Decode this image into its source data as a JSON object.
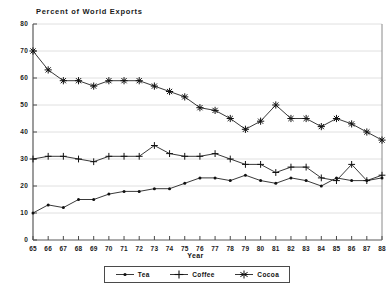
{
  "chart_data": {
    "type": "line",
    "title": "Percent of World Exports",
    "xlabel": "Year",
    "ylabel": "",
    "xlim": [
      65,
      88
    ],
    "ylim": [
      0,
      80
    ],
    "ytick_step": 10,
    "grid": true,
    "legend_position": "bottom",
    "x": [
      65,
      66,
      67,
      68,
      69,
      70,
      71,
      72,
      73,
      74,
      75,
      76,
      77,
      78,
      79,
      80,
      81,
      82,
      83,
      84,
      85,
      86,
      87,
      88
    ],
    "xtick_labels": [
      "65",
      "66",
      "67",
      "68",
      "69",
      "70",
      "71",
      "72",
      "73",
      "74",
      "75",
      "76",
      "77",
      "78",
      "79",
      "80",
      "81",
      "82",
      "83",
      "84",
      "85",
      "86",
      "87",
      "88"
    ],
    "ytick_labels": [
      "0",
      "10",
      "20",
      "30",
      "40",
      "50",
      "60",
      "70",
      "80"
    ],
    "series": [
      {
        "name": "Tea",
        "marker": "dot",
        "values": [
          10,
          13,
          12,
          15,
          15,
          17,
          18,
          18,
          19,
          19,
          21,
          23,
          23,
          22,
          24,
          22,
          21,
          23,
          22,
          20,
          23,
          22,
          22,
          23
        ]
      },
      {
        "name": "Coffee",
        "marker": "plus",
        "values": [
          30,
          31,
          31,
          30,
          29,
          31,
          31,
          31,
          35,
          32,
          31,
          31,
          32,
          30,
          28,
          28,
          25,
          27,
          27,
          23,
          22,
          28,
          22,
          24
        ]
      },
      {
        "name": "Cocoa",
        "marker": "asterisk",
        "values": [
          70,
          63,
          59,
          59,
          57,
          59,
          59,
          59,
          57,
          55,
          53,
          49,
          48,
          45,
          41,
          44,
          50,
          45,
          45,
          42,
          45,
          43,
          40,
          37
        ]
      }
    ]
  },
  "legend": {
    "items": [
      {
        "label": "Tea",
        "marker": "dot"
      },
      {
        "label": "Coffee",
        "marker": "plus"
      },
      {
        "label": "Cocoa",
        "marker": "asterisk"
      }
    ]
  }
}
